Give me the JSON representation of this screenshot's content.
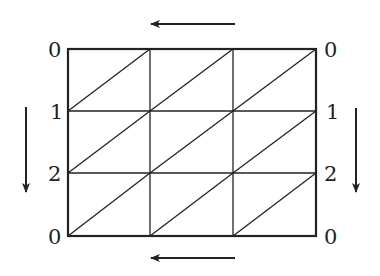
{
  "diagram": {
    "type": "triangulated-grid",
    "grid": {
      "columns": 3,
      "rows": 3,
      "left": 68,
      "right": 316,
      "top": 49,
      "bottom": 236
    },
    "diagonals": "bottom-left-to-top-right in every cell",
    "left_labels": [
      "0",
      "1",
      "2",
      "0"
    ],
    "right_labels": [
      "0",
      "1",
      "2",
      "0"
    ],
    "arrows": [
      {
        "name": "top-arrow",
        "direction": "left"
      },
      {
        "name": "bottom-arrow",
        "direction": "left"
      },
      {
        "name": "left-arrow",
        "direction": "down"
      },
      {
        "name": "right-arrow",
        "direction": "down"
      }
    ],
    "colors": {
      "line": "#222222",
      "background": "#ffffff"
    }
  }
}
